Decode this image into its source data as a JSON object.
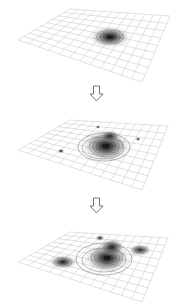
{
  "diagram": {
    "panels": [
      {
        "id": "stage-1",
        "grid": {
          "tl": [
            70,
            9
          ],
          "tr": [
            170,
            16
          ],
          "bl": [
            18,
            40
          ],
          "br": [
            142,
            82
          ]
        },
        "blobs": [
          {
            "cx": 110,
            "cy": 37,
            "rx": 17,
            "ry": 9,
            "strength": 1.0
          }
        ]
      },
      {
        "id": "stage-2",
        "grid": {
          "tl": [
            70,
            120
          ],
          "tr": [
            168,
            126
          ],
          "bl": [
            18,
            150
          ],
          "br": [
            142,
            190
          ]
        },
        "blobs": [
          {
            "cx": 106,
            "cy": 146,
            "rx": 20,
            "ry": 13,
            "strength": 1.0
          },
          {
            "cx": 110,
            "cy": 136,
            "rx": 9,
            "ry": 5,
            "strength": 0.8
          },
          {
            "cx": 98,
            "cy": 127,
            "rx": 2,
            "ry": 1.5,
            "strength": 0.7
          },
          {
            "cx": 138,
            "cy": 139,
            "rx": 2.5,
            "ry": 1.8,
            "strength": 0.7
          },
          {
            "cx": 61,
            "cy": 151,
            "rx": 3,
            "ry": 2,
            "strength": 0.8
          }
        ],
        "rings": [
          {
            "cx": 104,
            "cy": 147,
            "rx": 26,
            "ry": 14
          },
          {
            "cx": 103,
            "cy": 148,
            "rx": 21,
            "ry": 11
          }
        ]
      },
      {
        "id": "stage-3",
        "grid": {
          "tl": [
            70,
            232
          ],
          "tr": [
            168,
            238
          ],
          "bl": [
            18,
            262
          ],
          "br": [
            142,
            302
          ]
        },
        "blobs": [
          {
            "cx": 107,
            "cy": 258,
            "rx": 19,
            "ry": 12,
            "strength": 1.0
          },
          {
            "cx": 112,
            "cy": 247,
            "rx": 11,
            "ry": 7,
            "strength": 0.9
          },
          {
            "cx": 100,
            "cy": 238,
            "rx": 4,
            "ry": 2.5,
            "strength": 0.8
          },
          {
            "cx": 140,
            "cy": 250,
            "rx": 10,
            "ry": 5,
            "strength": 0.85
          },
          {
            "cx": 63,
            "cy": 262,
            "rx": 12,
            "ry": 6,
            "strength": 0.9
          }
        ],
        "rings": [
          {
            "cx": 104,
            "cy": 259,
            "rx": 28,
            "ry": 16
          },
          {
            "cx": 104,
            "cy": 260,
            "rx": 22,
            "ry": 12
          }
        ]
      }
    ],
    "arrows": [
      {
        "id": "arrow-1",
        "x": 96.5,
        "y": 86
      },
      {
        "id": "arrow-2",
        "x": 96.5,
        "y": 198
      }
    ],
    "colors": {
      "grid": "#c8c8c8",
      "blob": "#1a1a1a",
      "ring": "#555555",
      "arrow_stroke": "#666666",
      "arrow_fill": "#ffffff",
      "background": "#ffffff"
    }
  }
}
